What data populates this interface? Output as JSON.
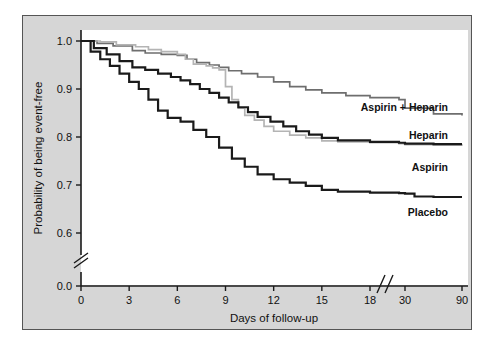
{
  "figure": {
    "background_color": "#d6d6d6",
    "plot_background_color": "#ffffff",
    "border_color": "#555555"
  },
  "chart_data": {
    "type": "line",
    "subtype": "kaplan-meier-step",
    "title": "",
    "xlabel": "Days of follow-up",
    "ylabel": "Probability of being event-free",
    "xlim": [
      0,
      90
    ],
    "ylim": [
      0.0,
      1.0
    ],
    "grid": false,
    "legend_position": "inline-right",
    "x_ticks": [
      0,
      3,
      6,
      9,
      12,
      15,
      18,
      30,
      90
    ],
    "x_tick_labels": [
      "0",
      "3",
      "6",
      "9",
      "12",
      "15",
      "18",
      "30",
      "90"
    ],
    "y_ticks": [
      0.0,
      0.6,
      0.7,
      0.8,
      0.9,
      1.0
    ],
    "y_tick_labels": [
      "0.0",
      "0.6",
      "0.7",
      "0.8",
      "0.9",
      "1.0"
    ],
    "y_axis_break_between": [
      0.0,
      0.6
    ],
    "x_axis_break_between": [
      18,
      30
    ],
    "series": [
      {
        "name": "Aspirin + Heparin",
        "color": "#6e6e6e",
        "line_width": 1.7,
        "label_x": 90,
        "final_value": 0.845,
        "x": [
          0,
          1.0,
          2.0,
          3.2,
          4.0,
          5.0,
          6.0,
          6.6,
          7.2,
          8.0,
          8.6,
          9.2,
          10.0,
          11.0,
          12.0,
          13.0,
          14.0,
          15.0,
          16.5,
          18.0,
          24.0,
          30.0,
          60.0,
          90.0
        ],
        "y": [
          1.0,
          0.995,
          0.99,
          0.98,
          0.975,
          0.972,
          0.97,
          0.962,
          0.955,
          0.95,
          0.945,
          0.938,
          0.932,
          0.925,
          0.915,
          0.905,
          0.898,
          0.892,
          0.886,
          0.882,
          0.878,
          0.86,
          0.848,
          0.845
        ]
      },
      {
        "name": "Aspirin",
        "color": "#b4b4b4",
        "line_width": 1.7,
        "label_x": 90,
        "final_value": 0.782,
        "x": [
          0,
          1.2,
          2.2,
          3.4,
          4.2,
          5.0,
          6.0,
          6.5,
          7.0,
          7.8,
          8.2,
          8.6,
          9.0,
          9.4,
          9.8,
          10.2,
          10.8,
          11.4,
          12.0,
          13.0,
          14.0,
          15.0,
          16.0,
          18.0,
          24.0,
          30.0,
          60.0,
          90.0
        ],
        "y": [
          1.0,
          0.998,
          0.992,
          0.988,
          0.982,
          0.978,
          0.972,
          0.962,
          0.952,
          0.948,
          0.944,
          0.94,
          0.905,
          0.878,
          0.86,
          0.845,
          0.835,
          0.822,
          0.812,
          0.804,
          0.798,
          0.792,
          0.79,
          0.788,
          0.786,
          0.784,
          0.783,
          0.782
        ]
      },
      {
        "name": "Heparin",
        "color": "#1a1a1a",
        "line_width": 2.2,
        "label_x": 90,
        "final_value": 0.785,
        "x": [
          0,
          0.8,
          1.6,
          2.4,
          3.2,
          4.0,
          4.8,
          5.6,
          6.2,
          6.8,
          7.4,
          8.0,
          8.6,
          9.2,
          9.8,
          10.4,
          11.0,
          11.8,
          12.6,
          13.4,
          14.2,
          15.0,
          16.0,
          18.0,
          24.0,
          30.0,
          60.0,
          90.0
        ],
        "y": [
          1.0,
          0.985,
          0.972,
          0.958,
          0.945,
          0.94,
          0.932,
          0.925,
          0.918,
          0.91,
          0.9,
          0.892,
          0.882,
          0.872,
          0.862,
          0.852,
          0.842,
          0.832,
          0.822,
          0.812,
          0.805,
          0.798,
          0.793,
          0.79,
          0.788,
          0.786,
          0.785,
          0.785
        ]
      },
      {
        "name": "Placebo",
        "color": "#1a1a1a",
        "line_width": 2.2,
        "label_x": 90,
        "final_value": 0.675,
        "x": [
          0,
          0.6,
          1.2,
          1.8,
          2.4,
          3.0,
          3.6,
          4.2,
          4.8,
          5.4,
          6.2,
          7.0,
          7.8,
          8.6,
          9.4,
          10.2,
          11.0,
          12.0,
          13.0,
          14.0,
          15.0,
          16.0,
          18.0,
          24.0,
          30.0,
          40.0,
          60.0,
          90.0
        ],
        "y": [
          1.0,
          0.978,
          0.962,
          0.948,
          0.932,
          0.915,
          0.9,
          0.878,
          0.855,
          0.84,
          0.832,
          0.815,
          0.8,
          0.778,
          0.755,
          0.738,
          0.722,
          0.712,
          0.705,
          0.698,
          0.69,
          0.686,
          0.684,
          0.683,
          0.682,
          0.676,
          0.675,
          0.675
        ]
      }
    ]
  },
  "labels": {
    "aspirin_heparin": "Aspirin + Heparin",
    "heparin": "Heparin",
    "aspirin": "Aspirin",
    "placebo": "Placebo",
    "x_axis_title": "Days of follow-up",
    "y_axis_title": "Probability of being event-free"
  }
}
